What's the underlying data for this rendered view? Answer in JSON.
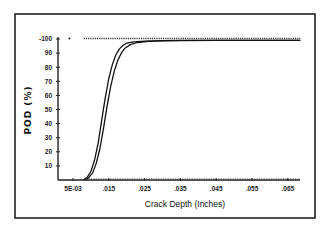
{
  "chart_data": {
    "type": "line",
    "title": "",
    "xlabel": "Crack Depth (Inches)",
    "ylabel": "POD (%)",
    "xlim": [
      0.001,
      0.0705
    ],
    "ylim": [
      0,
      100
    ],
    "grid": false,
    "legend": null,
    "x_ticks": [
      {
        "value": 0.005,
        "label": "5E-03"
      },
      {
        "value": 0.015,
        "label": ".015"
      },
      {
        "value": 0.025,
        "label": ".025"
      },
      {
        "value": 0.035,
        "label": ".035"
      },
      {
        "value": 0.045,
        "label": ".045"
      },
      {
        "value": 0.055,
        "label": ".055"
      },
      {
        "value": 0.065,
        "label": ".065"
      }
    ],
    "y_ticks": [
      {
        "value": 10,
        "label": "10"
      },
      {
        "value": 20,
        "label": "20"
      },
      {
        "value": 30,
        "label": "30"
      },
      {
        "value": 40,
        "label": "40"
      },
      {
        "value": 50,
        "label": "50"
      },
      {
        "value": 60,
        "label": "60"
      },
      {
        "value": 70,
        "label": "70"
      },
      {
        "value": 80,
        "label": "80"
      },
      {
        "value": 90,
        "label": "90"
      },
      {
        "value": 100,
        "label": "-100"
      }
    ],
    "series": [
      {
        "name": "POD curve (upper bound)",
        "style": "solid",
        "x": [
          0.008,
          0.009,
          0.01,
          0.011,
          0.012,
          0.013,
          0.014,
          0.015,
          0.016,
          0.017,
          0.018,
          0.019,
          0.02,
          0.022,
          0.025,
          0.03,
          0.035,
          0.045,
          0.055,
          0.0685
        ],
        "y": [
          0,
          2,
          6,
          14,
          26,
          42,
          58,
          72,
          82,
          89,
          93,
          95.5,
          97,
          98,
          98.5,
          98.8,
          99,
          99,
          99,
          99
        ]
      },
      {
        "name": "POD curve (lower bound)",
        "style": "solid",
        "x": [
          0.0085,
          0.0095,
          0.0105,
          0.0115,
          0.0125,
          0.0135,
          0.0145,
          0.0155,
          0.0165,
          0.0175,
          0.0185,
          0.0195,
          0.021,
          0.023,
          0.026,
          0.03,
          0.035,
          0.045,
          0.055,
          0.0685
        ],
        "y": [
          0,
          2,
          5,
          12,
          22,
          36,
          52,
          66,
          77,
          85,
          90,
          93.5,
          96,
          97.5,
          98.3,
          98.7,
          98.9,
          99,
          99,
          99
        ]
      },
      {
        "name": "hit/miss data (hits)",
        "style": "dotted",
        "x": [
          0.004,
          0.008,
          0.0685
        ],
        "y": [
          100,
          100,
          100
        ]
      },
      {
        "name": "hit/miss data (misses)",
        "style": "dotted",
        "x": [
          0.008,
          0.0685
        ],
        "y": [
          0,
          0
        ]
      }
    ]
  }
}
